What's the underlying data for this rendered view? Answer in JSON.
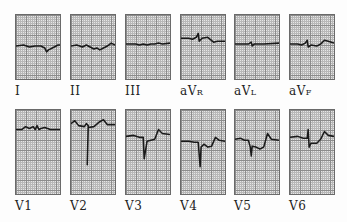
{
  "figure": {
    "rows": [
      {
        "leads": [
          {
            "name": "I",
            "base": "I",
            "sub": "",
            "trace": "M0,32 L8,31 L14,33 L20,32 L26,32 L30,34 L32,38 L34,36 L38,34 L44,31 L46,31"
          },
          {
            "name": "II",
            "base": "II",
            "sub": "",
            "trace": "M0,32 L6,31 L12,33 L16,31 L20,33 L24,35 L27,34 L30,36 L34,34 L38,32 L42,29 L46,31"
          },
          {
            "name": "III",
            "base": "III",
            "sub": "",
            "trace": "M0,30 L10,30 L14,31 L18,30 L22,31 L26,30 L30,30 L34,29 L38,30 L46,29"
          },
          {
            "name": "aVR",
            "base": "aV",
            "sub": "R",
            "trace": "M0,24 L8,24 L12,25 L16,23 L18,19 L19,27 L22,24 L28,23 L34,28 L38,27 L46,27"
          },
          {
            "name": "aVL",
            "base": "aV",
            "sub": "L",
            "trace": "M0,30 L14,30 L17,28 L18,32 L20,30 L30,30 L46,29"
          },
          {
            "name": "aVF",
            "base": "aV",
            "sub": "F",
            "trace": "M0,30 L8,30 L12,31 L16,29 L18,26 L19,33 L22,31 L28,32 L32,30 L36,26 L40,27 L46,29"
          }
        ],
        "top": 14,
        "height": 66
      },
      {
        "leads": [
          {
            "name": "V1",
            "base": "V",
            "sub": "1",
            "trace": "M0,20 L6,20 L10,17 L14,19 L18,17 L20,20 L22,16 L24,20 L26,19 L30,18 L36,20 L46,20"
          },
          {
            "name": "V2",
            "base": "V",
            "sub": "2",
            "trace": "M0,14 L4,11 L8,16 L14,17 L16,14 L18,16 L17,56 L18,18 L24,17 L30,12 L34,10 L38,15 L46,15"
          },
          {
            "name": "V3",
            "base": "V",
            "sub": "3",
            "trace": "M0,27 L8,26 L14,28 L18,28 L19,50 L21,38 L22,32 L26,31 L30,30 L34,20 L38,24 L46,25"
          },
          {
            "name": "V4",
            "base": "V",
            "sub": "4",
            "trace": "M0,32 L8,32 L14,33 L18,33 L20,58 L21,38 L24,35 L28,38 L32,37 L36,28 L40,31 L46,32"
          },
          {
            "name": "V5",
            "base": "V",
            "sub": "5",
            "trace": "M0,30 L6,29 L10,31 L14,31 L16,38 L17,47 L18,37 L22,38 L26,40 L30,38 L34,24 L38,30 L46,31"
          },
          {
            "name": "V6",
            "base": "V",
            "sub": "6",
            "trace": "M0,28 L8,27 L14,29 L18,29 L19,20 L20,38 L22,34 L28,34 L32,30 L36,22 L40,26 L46,27"
          }
        ],
        "top": 109,
        "height": 86
      }
    ],
    "columns_x": [
      15,
      70,
      125,
      180,
      234,
      289
    ],
    "strip_width": 46,
    "trace_color": "#1a1a1a"
  }
}
